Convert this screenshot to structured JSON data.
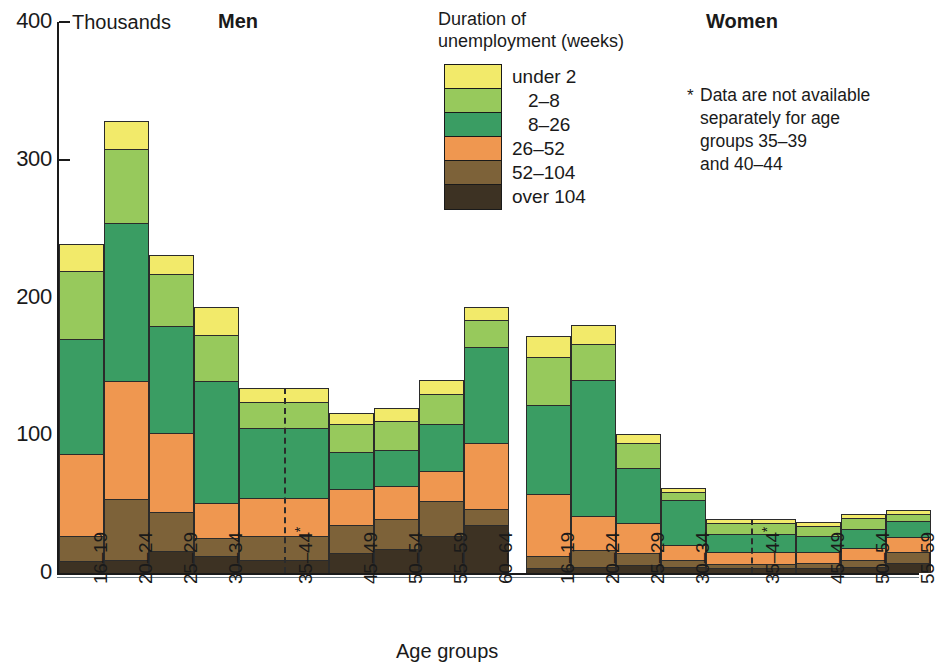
{
  "units_label": "Thousands",
  "panels": {
    "men_title": "Men",
    "women_title": "Women"
  },
  "axis": {
    "title": "Age groups",
    "y_ticks": [
      "400",
      "300",
      "200",
      "100",
      "0"
    ],
    "y_values": [
      400,
      300,
      200,
      100,
      0
    ],
    "y_max": 400
  },
  "legend": {
    "heading": "Duration of\nunemployment (weeks)",
    "items": [
      {
        "label": "under 2",
        "color": "#f2ea6a"
      },
      {
        "label": "2–8",
        "color": "#97c95c"
      },
      {
        "label": "8–26",
        "color": "#3a9d63"
      },
      {
        "label": "26–52",
        "color": "#ef9750"
      },
      {
        "label": "52–104",
        "color": "#7d6239"
      },
      {
        "label": "over 104",
        "color": "#3d3223"
      }
    ]
  },
  "footnote": {
    "marker": "*",
    "text": "Data are not available\nseparately for age\ngroups  35–39\nand 40–44"
  },
  "chart_data": {
    "type": "bar",
    "subtype": "stacked",
    "xlabel": "Age groups",
    "ylabel": "Thousands",
    "ylim": [
      0,
      400
    ],
    "grid": false,
    "legend_position": "top-center",
    "series": [
      {
        "name": "under 2",
        "color": "#f2ea6a"
      },
      {
        "name": "2–8",
        "color": "#97c95c"
      },
      {
        "name": "8–26",
        "color": "#3a9d63"
      },
      {
        "name": "26–52",
        "color": "#ef9750"
      },
      {
        "name": "52–104",
        "color": "#7d6239"
      },
      {
        "name": "over 104",
        "color": "#3d3223"
      }
    ],
    "panels": [
      {
        "name": "Men",
        "categories": [
          "16–19",
          "20–24",
          "25–29",
          "30–34",
          "35–44*",
          "45–49",
          "50–54",
          "55–59",
          "60–64"
        ],
        "double_width_category": "35–44*",
        "stacks": [
          {
            "category": "16–19",
            "values": {
              "under 2": 20,
              "2–8": 49,
              "8–26": 84,
              "26–52": 60,
              "52–104": 18,
              "over 104": 8
            },
            "total": 239
          },
          {
            "category": "20–24",
            "values": {
              "under 2": 20,
              "2–8": 54,
              "8–26": 115,
              "26–52": 86,
              "52–104": 44,
              "over 104": 9
            },
            "total": 328
          },
          {
            "category": "25–29",
            "values": {
              "under 2": 14,
              "2–8": 38,
              "8–26": 78,
              "26–52": 57,
              "52–104": 29,
              "over 104": 15
            },
            "total": 231
          },
          {
            "category": "30–34",
            "values": {
              "under 2": 20,
              "2–8": 34,
              "8–26": 89,
              "26–52": 25,
              "52–104": 13,
              "over 104": 12
            },
            "total": 193
          },
          {
            "category": "35–44*",
            "values": {
              "under 2": 10,
              "2–8": 19,
              "8–26": 51,
              "26–52": 28,
              "52–104": 17,
              "over 104": 9
            },
            "total": 134
          },
          {
            "category": "45–49",
            "values": {
              "under 2": 8,
              "2–8": 20,
              "8–26": 27,
              "26–52": 27,
              "52–104": 20,
              "over 104": 14
            },
            "total": 116
          },
          {
            "category": "50–54",
            "values": {
              "under 2": 10,
              "2–8": 21,
              "8–26": 26,
              "26–52": 24,
              "52–104": 22,
              "over 104": 17
            },
            "total": 120
          },
          {
            "category": "55–59",
            "values": {
              "under 2": 10,
              "2–8": 22,
              "8–26": 34,
              "26–52": 22,
              "52–104": 26,
              "over 104": 26
            },
            "total": 140
          },
          {
            "category": "60–64",
            "values": {
              "under 2": 9,
              "2–8": 20,
              "8–26": 70,
              "26–52": 48,
              "52–104": 12,
              "over 104": 34
            },
            "total": 193
          }
        ]
      },
      {
        "name": "Women",
        "categories": [
          "16–19",
          "20–24",
          "25–29",
          "30–34",
          "35–44*",
          "45–49",
          "50–54",
          "55–59"
        ],
        "double_width_category": "35–44*",
        "stacks": [
          {
            "category": "16–19",
            "values": {
              "under 2": 15,
              "2–8": 35,
              "8–26": 65,
              "26–52": 45,
              "52–104": 9,
              "over 104": 3
            },
            "total": 172
          },
          {
            "category": "20–24",
            "values": {
              "under 2": 14,
              "2–8": 26,
              "8–26": 99,
              "26–52": 25,
              "52–104": 12,
              "over 104": 4
            },
            "total": 180
          },
          {
            "category": "25–29",
            "values": {
              "under 2": 7,
              "2–8": 18,
              "8–26": 40,
              "26–52": 22,
              "52–104": 9,
              "over 104": 5
            },
            "total": 101
          },
          {
            "category": "30–34",
            "values": {
              "under 2": 3,
              "2–8": 6,
              "8–26": 33,
              "26–52": 11,
              "52–104": 5,
              "over 104": 4
            },
            "total": 62
          },
          {
            "category": "35–44*",
            "values": {
              "under 2": 3,
              "2–8": 8,
              "8–26": 13,
              "26–52": 9,
              "52–104": 3,
              "over 104": 3
            },
            "total": 39
          },
          {
            "category": "45–49",
            "values": {
              "under 2": 3,
              "2–8": 7,
              "8–26": 12,
              "26–52": 8,
              "52–104": 4,
              "over 104": 3
            },
            "total": 37
          },
          {
            "category": "50–54",
            "values": {
              "under 2": 3,
              "2–8": 8,
              "8–26": 14,
              "26–52": 9,
              "52–104": 5,
              "over 104": 4
            },
            "total": 43
          },
          {
            "category": "55–59",
            "values": {
              "under 2": 3,
              "2–8": 5,
              "8–26": 12,
              "26–52": 11,
              "52–104": 8,
              "over 104": 7
            },
            "total": 46
          }
        ]
      }
    ]
  },
  "layout": {
    "men_bar_left": 59,
    "women_bar_left": 526,
    "bar_width": 45,
    "baseline_y": 573,
    "top_y": 22
  }
}
